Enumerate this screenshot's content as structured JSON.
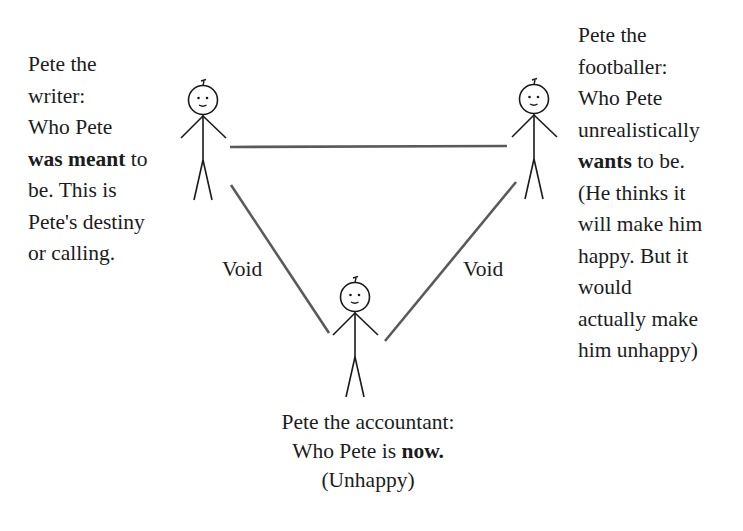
{
  "diagram": {
    "type": "triangle-relationship-diagram",
    "nodes": {
      "writer": {
        "lines": [
          {
            "parts": [
              {
                "text": "Pete the",
                "bold": false
              }
            ]
          },
          {
            "parts": [
              {
                "text": "writer:",
                "bold": false
              }
            ]
          },
          {
            "parts": [
              {
                "text": "Who Pete",
                "bold": false
              }
            ]
          },
          {
            "parts": [
              {
                "text": "was meant",
                "bold": true
              },
              {
                "text": " to",
                "bold": false
              }
            ]
          },
          {
            "parts": [
              {
                "text": "be. This is",
                "bold": false
              }
            ]
          },
          {
            "parts": [
              {
                "text": "Pete's destiny",
                "bold": false
              }
            ]
          },
          {
            "parts": [
              {
                "text": "or calling.",
                "bold": false
              }
            ]
          }
        ]
      },
      "footballer": {
        "lines": [
          {
            "parts": [
              {
                "text": "Pete the",
                "bold": false
              }
            ]
          },
          {
            "parts": [
              {
                "text": "footballer:",
                "bold": false
              }
            ]
          },
          {
            "parts": [
              {
                "text": "Who Pete",
                "bold": false
              }
            ]
          },
          {
            "parts": [
              {
                "text": "unrealistically",
                "bold": false
              }
            ]
          },
          {
            "parts": [
              {
                "text": "wants",
                "bold": true
              },
              {
                "text": " to be.",
                "bold": false
              }
            ]
          },
          {
            "parts": [
              {
                "text": "(He thinks it",
                "bold": false
              }
            ]
          },
          {
            "parts": [
              {
                "text": "will make him",
                "bold": false
              }
            ]
          },
          {
            "parts": [
              {
                "text": "happy. But it",
                "bold": false
              }
            ]
          },
          {
            "parts": [
              {
                "text": "would",
                "bold": false
              }
            ]
          },
          {
            "parts": [
              {
                "text": "actually make",
                "bold": false
              }
            ]
          },
          {
            "parts": [
              {
                "text": "him unhappy)",
                "bold": false
              }
            ]
          }
        ]
      },
      "accountant": {
        "lines": [
          {
            "parts": [
              {
                "text": "Pete the accountant:",
                "bold": false
              }
            ]
          },
          {
            "parts": [
              {
                "text": "Who Pete is ",
                "bold": false
              },
              {
                "text": "now.",
                "bold": true
              }
            ]
          },
          {
            "parts": [
              {
                "text": "(Unhappy)",
                "bold": false
              }
            ]
          }
        ]
      }
    },
    "edges": {
      "writer_to_accountant": {
        "label": "Void"
      },
      "footballer_to_accountant": {
        "label": "Void"
      },
      "writer_to_footballer": {
        "label": ""
      }
    },
    "figures": [
      {
        "id": "writer",
        "icon": "stick-figure-icon",
        "cx": 203,
        "cy": 100
      },
      {
        "id": "footballer",
        "icon": "stick-figure-icon",
        "cx": 534,
        "cy": 99
      },
      {
        "id": "accountant",
        "icon": "stick-figure-icon",
        "cx": 355,
        "cy": 297
      }
    ],
    "colors": {
      "text": "#1c1c1c",
      "line": "#555555",
      "figure": "#1a1a1a",
      "background": "#ffffff"
    }
  }
}
